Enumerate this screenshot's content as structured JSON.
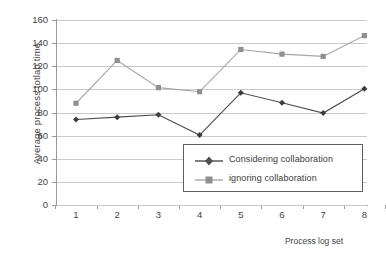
{
  "chart_data": {
    "type": "line",
    "title": "",
    "xlabel": "Process log set",
    "ylabel": "Average process totlao time",
    "categories": [
      "1",
      "2",
      "3",
      "4",
      "5",
      "6",
      "7",
      "8"
    ],
    "ylim": [
      0,
      160
    ],
    "yticks": [
      0,
      20,
      40,
      60,
      80,
      100,
      120,
      140,
      160
    ],
    "ytick_labels": [
      "0",
      "20",
      "40",
      "60",
      "80",
      "100",
      "120",
      "140",
      "160"
    ],
    "grid": true,
    "legend_position": "inside-lower-right",
    "series": [
      {
        "name": "Considering collaboration",
        "values": [
          74,
          76,
          78,
          60.5,
          97,
          88.5,
          79.5,
          100.5
        ],
        "color": "#4d4d4d",
        "marker": "diamond"
      },
      {
        "name": "ignoring collaboration",
        "values": [
          88,
          125,
          101.5,
          98,
          134.5,
          130.5,
          128.5,
          146.5
        ],
        "color": "#a6a6a6",
        "marker": "square"
      }
    ]
  },
  "legend": {
    "entries": [
      {
        "label": "Considering collaboration"
      },
      {
        "label": "ignoring collaboration"
      }
    ]
  },
  "axes": {
    "y_title": "Average process totlao time",
    "x_title": "Process log set"
  },
  "colors": {
    "series_dark": "#4d4d4d",
    "series_gray": "#a6a6a6",
    "gridline": "#c9c9c9",
    "axis": "#9a9a9a",
    "text": "#3f3f3f",
    "legend_border": "#5e5e5e",
    "background": "#ffffff"
  }
}
